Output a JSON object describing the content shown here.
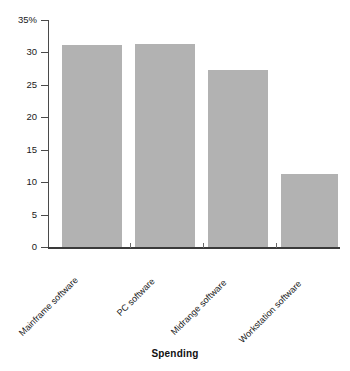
{
  "chart_data": {
    "type": "bar",
    "title": "",
    "subtitle": "",
    "xlabel": "Spending",
    "ylabel": "",
    "categories": [
      "Mainframe software",
      "PC software",
      "Midrange software",
      "Workstation software"
    ],
    "values": [
      31.2,
      31.3,
      27.3,
      11.2
    ],
    "ylim": [
      0,
      35
    ],
    "yticks": [
      0,
      5,
      10,
      15,
      20,
      25,
      30,
      35
    ],
    "ytick_labels": [
      "0",
      "5",
      "10",
      "15",
      "20",
      "25",
      "30",
      "35%"
    ],
    "grid": false,
    "legend": null,
    "bar_color": "#b2b2b2",
    "axis_color": "#4a4a4a",
    "units": "percent"
  },
  "axis": {
    "x_title": "Spending"
  }
}
